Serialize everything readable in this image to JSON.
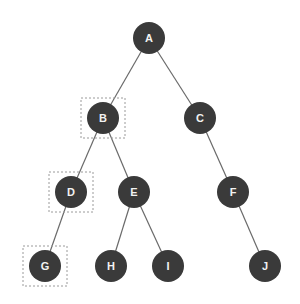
{
  "diagram": {
    "type": "binary-tree",
    "style": {
      "node_fill": "#3a3a3a",
      "node_text": "#f2f2f2",
      "edge_color": "#6a6a6a",
      "highlight_box_color": "#9a9a9a",
      "node_radius": 16
    },
    "nodes": [
      {
        "id": "A",
        "label": "A",
        "x": 149,
        "y": 38,
        "highlighted": false
      },
      {
        "id": "B",
        "label": "B",
        "x": 103,
        "y": 118,
        "highlighted": true
      },
      {
        "id": "C",
        "label": "C",
        "x": 200,
        "y": 118,
        "highlighted": false
      },
      {
        "id": "D",
        "label": "D",
        "x": 71,
        "y": 192,
        "highlighted": true
      },
      {
        "id": "E",
        "label": "E",
        "x": 134,
        "y": 192,
        "highlighted": false
      },
      {
        "id": "F",
        "label": "F",
        "x": 233,
        "y": 192,
        "highlighted": false
      },
      {
        "id": "G",
        "label": "G",
        "x": 45,
        "y": 266,
        "highlighted": true
      },
      {
        "id": "H",
        "label": "H",
        "x": 111,
        "y": 266,
        "highlighted": false
      },
      {
        "id": "I",
        "label": "I",
        "x": 168,
        "y": 266,
        "highlighted": false
      },
      {
        "id": "J",
        "label": "J",
        "x": 265,
        "y": 266,
        "highlighted": false
      }
    ],
    "edges": [
      {
        "from": "A",
        "to": "B"
      },
      {
        "from": "A",
        "to": "C"
      },
      {
        "from": "B",
        "to": "D"
      },
      {
        "from": "B",
        "to": "E"
      },
      {
        "from": "C",
        "to": "F"
      },
      {
        "from": "D",
        "to": "G"
      },
      {
        "from": "E",
        "to": "H"
      },
      {
        "from": "E",
        "to": "I"
      },
      {
        "from": "F",
        "to": "J"
      }
    ]
  }
}
